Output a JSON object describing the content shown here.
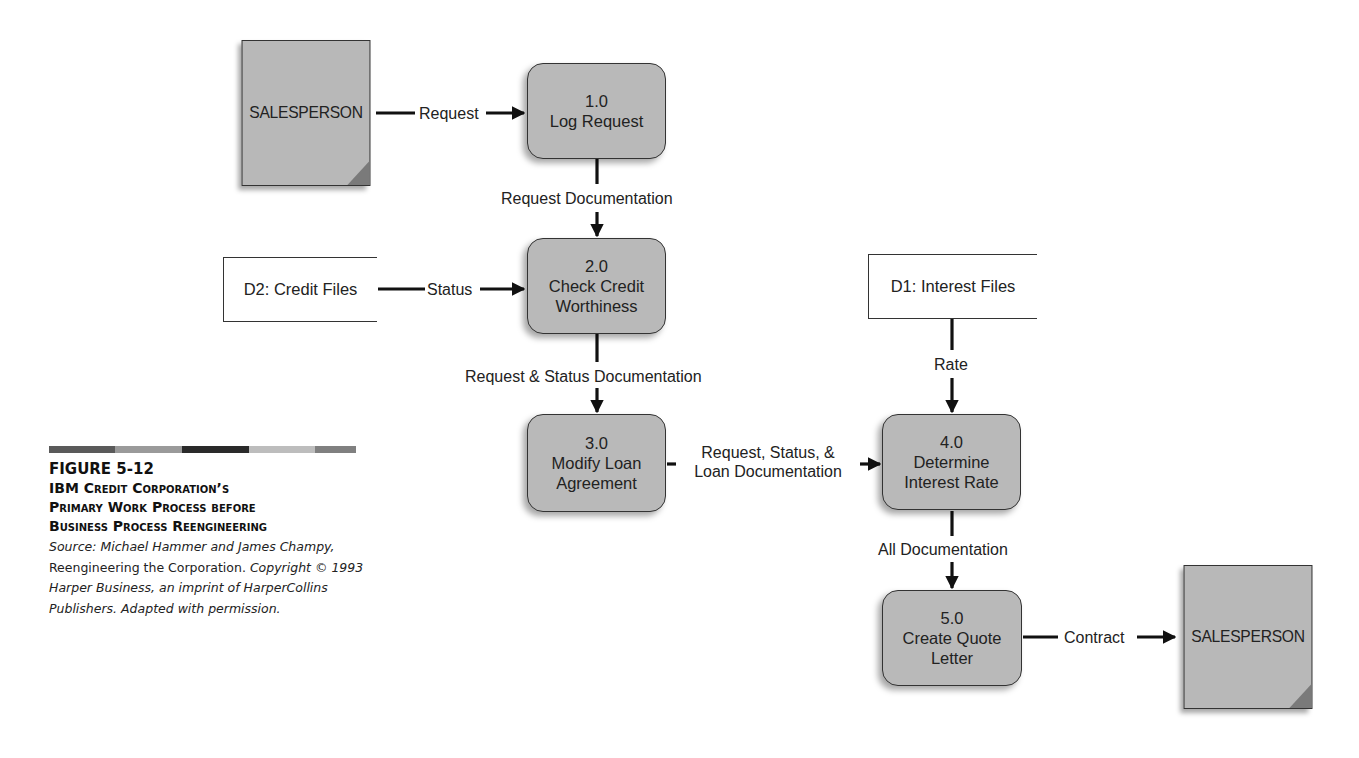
{
  "diagram": {
    "type": "data-flow-diagram",
    "external_entities": [
      {
        "id": "salesperson-in",
        "label": "SALESPERSON"
      },
      {
        "id": "salesperson-out",
        "label": "SALESPERSON"
      }
    ],
    "processes": [
      {
        "id": "p1",
        "number": "1.0",
        "name_lines": [
          "Log Request"
        ]
      },
      {
        "id": "p2",
        "number": "2.0",
        "name_lines": [
          "Check Credit",
          "Worthiness"
        ]
      },
      {
        "id": "p3",
        "number": "3.0",
        "name_lines": [
          "Modify Loan",
          "Agreement"
        ]
      },
      {
        "id": "p4",
        "number": "4.0",
        "name_lines": [
          "Determine",
          "Interest Rate"
        ]
      },
      {
        "id": "p5",
        "number": "5.0",
        "name_lines": [
          "Create Quote",
          "Letter"
        ]
      }
    ],
    "data_stores": [
      {
        "id": "d2",
        "label": "D2: Credit Files"
      },
      {
        "id": "d1",
        "label": "D1: Interest Files"
      }
    ],
    "flows": [
      {
        "from": "salesperson-in",
        "to": "p1",
        "label": "Request"
      },
      {
        "from": "p1",
        "to": "p2",
        "label": "Request Documentation"
      },
      {
        "from": "d2",
        "to": "p2",
        "label": "Status"
      },
      {
        "from": "p2",
        "to": "p3",
        "label": "Request & Status Documentation"
      },
      {
        "from": "p3",
        "to": "p4",
        "label_lines": [
          "Request, Status, &",
          "Loan Documentation"
        ]
      },
      {
        "from": "d1",
        "to": "p4",
        "label": "Rate"
      },
      {
        "from": "p4",
        "to": "p5",
        "label": "All Documentation"
      },
      {
        "from": "p5",
        "to": "salesperson-out",
        "label": "Contract"
      }
    ]
  },
  "caption": {
    "figure_number": "FIGURE 5-12",
    "title_lines": [
      "IBM Credit Corporation’s",
      "Primary Work Process before",
      "Business Process Reengineering"
    ],
    "source": {
      "prefix_italic": "Source: Michael Hammer and James Champy,",
      "book_title": "Reengineering the Corporation.",
      "copyright_italic": "Copyright © 1993 Harper Business, an imprint of HarperCollins Publishers. Adapted with permission."
    },
    "bar_colors": [
      "#5a5a5a",
      "#9a9a9a",
      "#2a2a2a",
      "#bdbdbd",
      "#808080"
    ]
  }
}
